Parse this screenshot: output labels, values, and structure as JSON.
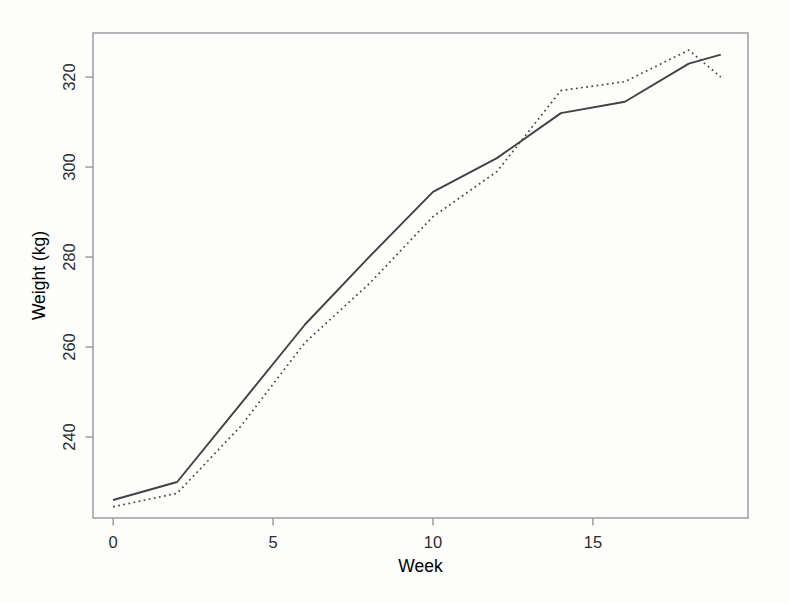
{
  "figure": {
    "background": "#fdfdfc",
    "plot_background": "#ffffff"
  },
  "chart_data": {
    "type": "line",
    "title": "",
    "xlabel": "Week",
    "ylabel": "Weight (kg)",
    "x": [
      0,
      2,
      4,
      6,
      8,
      10,
      12,
      14,
      16,
      18,
      19
    ],
    "series": [
      {
        "name": "solid-line-series",
        "style": "solid",
        "color": "#424242",
        "values": [
          226,
          230,
          247.5,
          265,
          280,
          294.5,
          302,
          312,
          314.5,
          323,
          325
        ]
      },
      {
        "name": "dotted-line-series",
        "style": "dotted",
        "color": "#4a4a4a",
        "values": [
          224.5,
          227.5,
          242.5,
          261,
          274,
          289,
          299,
          317,
          319,
          326,
          320
        ]
      }
    ],
    "xlim": [
      -0.63,
      19.85
    ],
    "ylim": [
      222,
      329.8
    ],
    "x_ticks": [
      0,
      5,
      10,
      15
    ],
    "y_ticks": [
      240,
      260,
      280,
      300,
      320
    ],
    "grid": false,
    "legend": "none",
    "frame_color": "#8f8f8f",
    "text_color": "#2e2e2e"
  }
}
